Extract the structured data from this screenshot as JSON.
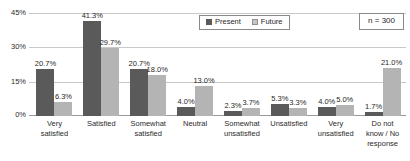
{
  "chart_data": {
    "type": "bar",
    "title": "",
    "xlabel": "",
    "ylabel": "",
    "ylim": [
      0,
      45
    ],
    "yticks": [
      "0%",
      "15%",
      "30%",
      "45%"
    ],
    "ytick_values": [
      0,
      15,
      30,
      45
    ],
    "grid": true,
    "legend_position": "top-center",
    "categories": [
      "Very\nsatisfied",
      "Satisfied",
      "Somewhat\nsatisfied",
      "Neutral",
      "Somewhat\nunsatisfied",
      "Unsatisfied",
      "Very\nunsatisfied",
      "Do not\nknow / No\nresponse"
    ],
    "series": [
      {
        "name": "Present",
        "color": "#5a5a5a",
        "values": [
          20.7,
          41.3,
          20.7,
          4.0,
          2.3,
          5.3,
          4.0,
          1.7
        ],
        "labels": [
          "20.7%",
          "41.3%",
          "20.7%",
          "4.0%",
          "2.3%",
          "5.3%",
          "4.0%",
          "1.7%"
        ]
      },
      {
        "name": "Future",
        "color": "#b4b4b4",
        "values": [
          6.3,
          29.7,
          18.0,
          13.0,
          3.7,
          3.3,
          5.0,
          21.0
        ],
        "labels": [
          "6.3%",
          "29.7%",
          "18.0%",
          "13.0%",
          "3.7%",
          "3.3%",
          "5.0%",
          "21.0%"
        ]
      }
    ],
    "annotations": [
      {
        "name": "sample-size",
        "text": "n = 300"
      }
    ]
  },
  "legend": {
    "items": [
      {
        "label": "Present",
        "key": "present"
      },
      {
        "label": "Future",
        "key": "future"
      }
    ]
  },
  "sample_size_box": {
    "text": "n = 300"
  }
}
